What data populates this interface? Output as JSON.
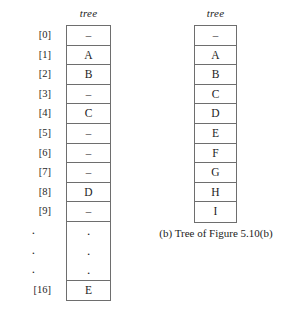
{
  "figure": {
    "caption": "(b) Tree of Figure 5.10(b)",
    "dash_glyph": "–",
    "dot_glyph": ".",
    "colors": {
      "background": "#ffffff",
      "text": "#1c1c1c",
      "border": "#6e6e6e"
    }
  },
  "left_array": {
    "title": "tree",
    "indices": [
      "[0]",
      "[1]",
      "[2]",
      "[3]",
      "[4]",
      "[5]",
      "[6]",
      "[7]",
      "[8]",
      "[9]",
      ".",
      ".",
      ".",
      "[16]"
    ],
    "cells": [
      "–",
      "A",
      "B",
      "–",
      "C",
      "–",
      "–",
      "–",
      "D",
      "–",
      ".",
      ".",
      ".",
      "E"
    ]
  },
  "right_array": {
    "title": "tree",
    "cells": [
      "–",
      "A",
      "B",
      "C",
      "D",
      "E",
      "F",
      "G",
      "H",
      "I"
    ]
  }
}
